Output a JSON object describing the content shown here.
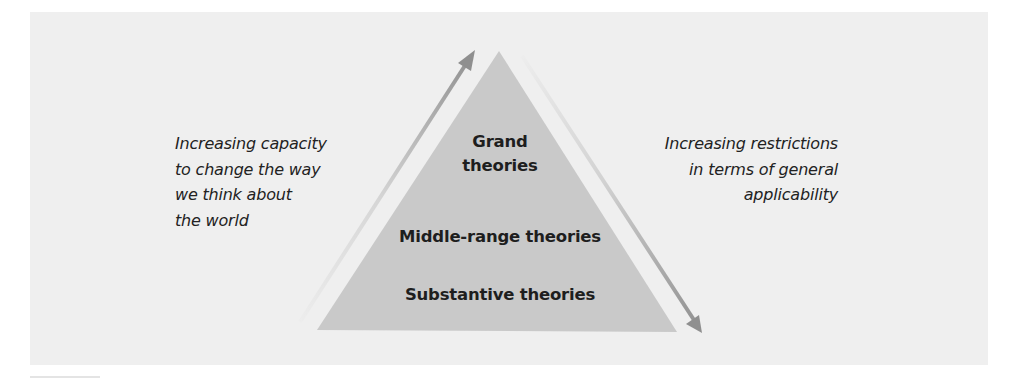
{
  "diagram": {
    "colors": {
      "background": "#ffffff",
      "panel": "#efefef",
      "triangle": "#c9c9c9",
      "arrow_dark": "#8f8f8f",
      "arrow_light": "#e6e6e6",
      "text": "#222222"
    },
    "tiers": [
      {
        "label": "Grand\ntheories"
      },
      {
        "label": "Middle-range theories"
      },
      {
        "label": "Substantive theories"
      }
    ],
    "left_annotation": {
      "text": "Increasing capacity\nto change the way\nwe think about\nthe world",
      "arrow_direction": "up"
    },
    "right_annotation": {
      "text": "Increasing restrictions\nin terms of general\napplicability",
      "arrow_direction": "down"
    }
  }
}
